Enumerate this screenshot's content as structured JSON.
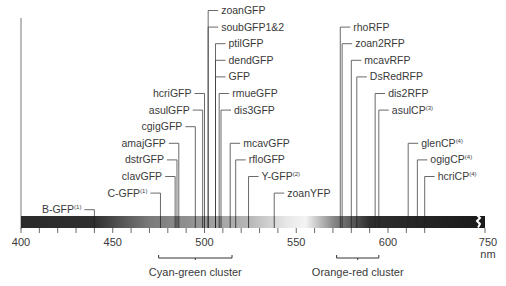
{
  "chart_data": {
    "type": "scatter",
    "title": "",
    "xlabel": "nm",
    "ylabel": "",
    "xlim": [
      400,
      750
    ],
    "axis_break": "between ~620 and 750",
    "tick_labels": [
      "400",
      "450",
      "500",
      "550",
      "600",
      "750"
    ],
    "unit_label": "nm",
    "grid": false,
    "gradient_bar": {
      "description": "spectrum bar: dark at 400, lightening through cyan-green to white near 550-560, darkening again through orange-red to black at far right",
      "stops": [
        {
          "nm": 400,
          "color": "#2a2a2a"
        },
        {
          "nm": 440,
          "color": "#303030"
        },
        {
          "nm": 470,
          "color": "#7a7a7a"
        },
        {
          "nm": 500,
          "color": "#9a9a9a"
        },
        {
          "nm": 525,
          "color": "#b8b8b8"
        },
        {
          "nm": 545,
          "color": "#e8e8e8"
        },
        {
          "nm": 555,
          "color": "#f4f4f4"
        },
        {
          "nm": 570,
          "color": "#8a8a8a"
        },
        {
          "nm": 590,
          "color": "#2e2e2e"
        },
        {
          "nm": 750,
          "color": "#1a1a1a"
        }
      ]
    },
    "proteins": [
      {
        "name": "B-GFP",
        "sup": "(1)",
        "nm": 440,
        "side": "left",
        "row": 13
      },
      {
        "name": "C-GFP",
        "sup": "(1)",
        "nm": 476,
        "side": "left",
        "row": 12
      },
      {
        "name": "clavGFP",
        "sup": "",
        "nm": 484,
        "side": "left",
        "row": 11
      },
      {
        "name": "dstrGFP",
        "sup": "",
        "nm": 485,
        "side": "left",
        "row": 10
      },
      {
        "name": "amajGFP",
        "sup": "",
        "nm": 486,
        "side": "left",
        "row": 9
      },
      {
        "name": "cgigGFP",
        "sup": "",
        "nm": 495,
        "side": "left",
        "row": 8
      },
      {
        "name": "asulGFP",
        "sup": "",
        "nm": 499,
        "side": "left",
        "row": 7
      },
      {
        "name": "hcriGFP",
        "sup": "",
        "nm": 500,
        "side": "left",
        "row": 6
      },
      {
        "name": "zoanGFP",
        "sup": "",
        "nm": 502,
        "side": "right",
        "row": 1
      },
      {
        "name": "soubGFP1&2",
        "sup": "",
        "nm": 502,
        "side": "right",
        "row": 2
      },
      {
        "name": "ptilGFP",
        "sup": "",
        "nm": 506,
        "side": "right",
        "row": 3
      },
      {
        "name": "dendGFP",
        "sup": "",
        "nm": 506,
        "side": "right",
        "row": 4
      },
      {
        "name": "GFP",
        "sup": "",
        "nm": 506,
        "side": "right",
        "row": 5
      },
      {
        "name": "rmueGFP",
        "sup": "",
        "nm": 508,
        "side": "right",
        "row": 6
      },
      {
        "name": "dis3GFP",
        "sup": "",
        "nm": 509,
        "side": "right",
        "row": 7
      },
      {
        "name": "mcavGFP",
        "sup": "",
        "nm": 514,
        "side": "right",
        "row": 9
      },
      {
        "name": "rfloGFP",
        "sup": "",
        "nm": 517,
        "side": "right",
        "row": 10
      },
      {
        "name": "Y-GFP",
        "sup": "(2)",
        "nm": 524,
        "side": "right",
        "row": 11
      },
      {
        "name": "zoanYFP",
        "sup": "",
        "nm": 538,
        "side": "right",
        "row": 12
      },
      {
        "name": "rhoRFP",
        "sup": "",
        "nm": 574,
        "side": "right",
        "row": 2
      },
      {
        "name": "zoan2RFP",
        "sup": "",
        "nm": 575,
        "side": "right",
        "row": 3
      },
      {
        "name": "mcavRFP",
        "sup": "",
        "nm": 580,
        "side": "right",
        "row": 4
      },
      {
        "name": "DsRedRFP",
        "sup": "",
        "nm": 583,
        "side": "right",
        "row": 5
      },
      {
        "name": "dis2RFP",
        "sup": "",
        "nm": 593,
        "side": "right",
        "row": 6
      },
      {
        "name": "asulCP",
        "sup": "(3)",
        "nm": 595,
        "side": "right",
        "row": 7
      },
      {
        "name": "glenCP",
        "sup": "(4)",
        "nm": 611,
        "side": "right",
        "row": 9
      },
      {
        "name": "ogigCP",
        "sup": "(4)",
        "nm": 616,
        "side": "right",
        "row": 10
      },
      {
        "name": "hcriCP",
        "sup": "(4)",
        "nm": 620,
        "side": "right",
        "row": 11
      }
    ],
    "clusters": [
      {
        "label": "Cyan-green cluster",
        "from_nm": 475,
        "to_nm": 515
      },
      {
        "label": "Orange-red cluster",
        "from_nm": 572,
        "to_nm": 595
      }
    ]
  }
}
